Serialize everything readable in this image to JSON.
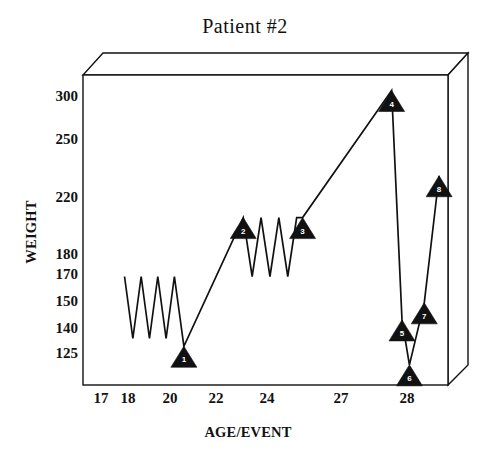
{
  "chart_data": {
    "type": "line",
    "title": "Patient  #2",
    "xlabel": "AGE/EVENT",
    "ylabel": "WEIGHT",
    "grid": false,
    "legend": "none",
    "xtick_labels": [
      "17",
      "18",
      "20",
      "22",
      "24",
      "27",
      "28"
    ],
    "xtick_values": [
      17,
      18,
      20,
      22,
      24,
      27,
      28
    ],
    "ytick_labels": [
      "300",
      "250",
      "220",
      "180",
      "170",
      "150",
      "140",
      "125"
    ],
    "ytick_values": [
      300,
      250,
      220,
      180,
      170,
      150,
      140,
      125
    ],
    "ylim": [
      110,
      310
    ],
    "xlim": [
      16.6,
      28.9
    ],
    "series": [
      {
        "name": "WEIGHT",
        "x": [
          18.0,
          18.28,
          18.56,
          18.84,
          19.12,
          19.4,
          19.68,
          20.0,
          22.0,
          22.3,
          22.6,
          22.9,
          23.2,
          23.5,
          23.8,
          24.0,
          27.0,
          27.35,
          27.6,
          28.1,
          28.6
        ],
        "values": [
          180,
          140,
          180,
          140,
          180,
          140,
          180,
          135,
          218,
          180,
          218,
          180,
          218,
          180,
          218,
          218,
          300,
          152,
          123,
          163,
          245
        ]
      }
    ],
    "markers": [
      {
        "label": "1",
        "x": 20.0,
        "value": 135
      },
      {
        "label": "2",
        "x": 22.0,
        "value": 218
      },
      {
        "label": "3",
        "x": 24.0,
        "value": 218
      },
      {
        "label": "4",
        "x": 27.0,
        "value": 300
      },
      {
        "label": "5",
        "x": 27.35,
        "value": 152
      },
      {
        "label": "6",
        "x": 27.6,
        "value": 123
      },
      {
        "label": "7",
        "x": 28.1,
        "value": 163
      },
      {
        "label": "8",
        "x": 28.6,
        "value": 245
      }
    ],
    "colors": {
      "line": "#111111",
      "marker": "#111111",
      "marker_label": "#ffffff",
      "frame": "#111111",
      "background": "#ffffff"
    }
  }
}
